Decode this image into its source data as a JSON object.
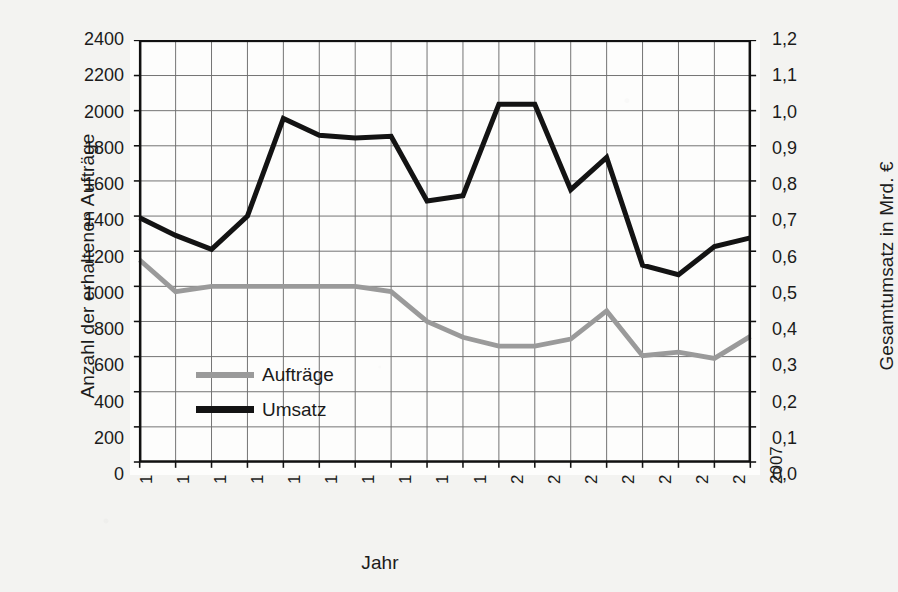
{
  "chart_data": {
    "type": "line",
    "title": "",
    "xlabel": "Jahr",
    "ylabel": "Anzahl der erhaltenen Aufträge",
    "y2label": "Gesamtumsatz in Mrd. €",
    "grid": true,
    "legend_position": "inside-left-middle",
    "categories": [
      "1990",
      "1991",
      "1992",
      "1993",
      "1994",
      "1995",
      "1996",
      "1997",
      "1998",
      "1999",
      "2000",
      "2001",
      "2002",
      "2003",
      "2004",
      "2005",
      "2006",
      "2007"
    ],
    "x": [
      1990,
      1991,
      1992,
      1993,
      1994,
      1995,
      1996,
      1997,
      1998,
      1999,
      2000,
      2001,
      2002,
      2003,
      2004,
      2005,
      2006,
      2007
    ],
    "ylim": [
      0,
      2400
    ],
    "yticks": [
      0,
      200,
      400,
      600,
      800,
      1000,
      1200,
      1400,
      1600,
      1800,
      2000,
      2200,
      2400
    ],
    "ytick_labels": [
      "0",
      "200",
      "400",
      "600",
      "800",
      "1000",
      "1200",
      "1400",
      "1600",
      "1800",
      "2000",
      "2200",
      "2400"
    ],
    "y2lim": [
      0.0,
      1.2
    ],
    "y2ticks": [
      0.0,
      0.1,
      0.2,
      0.3,
      0.4,
      0.5,
      0.6,
      0.7,
      0.8,
      0.9,
      1.0,
      1.1,
      1.2
    ],
    "y2tick_labels": [
      "0,0",
      "0,1",
      "0,2",
      "0,3",
      "0,4",
      "0,5",
      "0,6",
      "0,7",
      "0,8",
      "0,9",
      "1,0",
      "1,1",
      "1,2"
    ],
    "series": [
      {
        "name": "Aufträge",
        "axis": "left",
        "color": "#9a9a9a",
        "unit": "Anzahl",
        "values": [
          1150,
          970,
          1000,
          1000,
          1000,
          1000,
          1000,
          970,
          800,
          710,
          660,
          660,
          700,
          860,
          605,
          625,
          590,
          715
        ]
      },
      {
        "name": "Umsatz",
        "axis": "right",
        "color": "#131313",
        "unit": "Mrd. €",
        "values": [
          0.695,
          0.645,
          0.605,
          0.7,
          0.978,
          0.93,
          0.922,
          0.927,
          0.743,
          0.758,
          1.018,
          1.018,
          0.775,
          0.867,
          0.56,
          0.533,
          0.613,
          0.638
        ]
      }
    ],
    "series_right_as_left_scale": [
      1390,
      1290,
      1210,
      1400,
      1955,
      1860,
      1845,
      1855,
      1485,
      1515,
      2035,
      2035,
      1550,
      1735,
      1120,
      1065,
      1225,
      1275
    ]
  },
  "legend": {
    "items": [
      {
        "label": "Aufträge",
        "color": "#9a9a9a"
      },
      {
        "label": "Umsatz",
        "color": "#131313"
      }
    ]
  },
  "axes": {
    "left_title": "Anzahl der erhaltenen Aufträge",
    "right_title": "Gesamtumsatz in Mrd. €",
    "bottom_title": "Jahr"
  },
  "colors": {
    "auftraege": "#9a9a9a",
    "umsatz": "#131313",
    "grid": "#6f6f6f",
    "frame": "#111111",
    "page_background": "#f3f3f1",
    "plot_background": "#fdfdfc"
  }
}
